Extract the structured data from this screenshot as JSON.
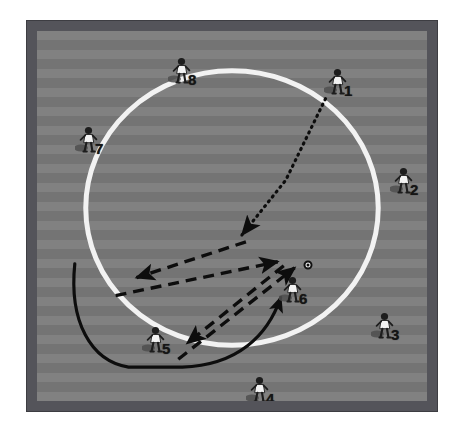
{
  "diagram": {
    "kind": "soccer-tactical-drill",
    "title": "",
    "field": {
      "frame_color": "#54545a",
      "grass_color": "#7c7c7c",
      "grass_stripe_color": "#747474",
      "line_color": "#f2f2f2",
      "background_color": "#ffffff"
    },
    "center_circle": {
      "label": "center-circle",
      "cx": 196,
      "cy": 178,
      "rx": 147,
      "ry": 138,
      "stroke_color": "#f2f2f2",
      "stroke_width": 5
    },
    "players": [
      {
        "id": "p1",
        "number": "1",
        "x": 300,
        "y": 51,
        "num_pos": "br",
        "has_ball": false
      },
      {
        "id": "p2",
        "number": "2",
        "x": 366,
        "y": 150,
        "num_pos": "br",
        "has_ball": false
      },
      {
        "id": "p3",
        "number": "3",
        "x": 347,
        "y": 295,
        "num_pos": "br",
        "has_ball": false
      },
      {
        "id": "p4",
        "number": "4",
        "x": 222,
        "y": 359,
        "num_pos": "br",
        "has_ball": false
      },
      {
        "id": "p5",
        "number": "5",
        "x": 118,
        "y": 309,
        "num_pos": "br",
        "has_ball": false
      },
      {
        "id": "p6",
        "number": "6",
        "x": 255,
        "y": 259,
        "num_pos": "br",
        "has_ball": true
      },
      {
        "id": "p7",
        "number": "7",
        "x": 51,
        "y": 109,
        "num_pos": "br",
        "has_ball": false
      },
      {
        "id": "p8",
        "number": "8",
        "x": 144,
        "y": 40,
        "num_pos": "br",
        "has_ball": false
      }
    ],
    "ball": {
      "label": "soccer-ball",
      "x": 271,
      "y": 234
    },
    "movement_paths": [
      {
        "id": "path-pass-from-1",
        "style": "dotted",
        "label": "pass-from-player-1-into-center",
        "points": "290,68 250,150 204,205",
        "arrowhead": "end"
      },
      {
        "id": "path-run-center-to-left",
        "style": "dashed",
        "label": "run-from-center-to-left",
        "points": "206,208 100,247",
        "arrowhead": "end"
      },
      {
        "id": "path-run-left-to-right",
        "style": "dashed",
        "label": "run-from-left-to-right",
        "points": "79,265 243,232",
        "arrowhead": "end"
      },
      {
        "id": "path-run-right-to-player5",
        "style": "dashed",
        "label": "run-from-right-down-to-player-5",
        "points": "244,234 150,313",
        "arrowhead": "end"
      },
      {
        "id": "path-run-player5-to-ball",
        "style": "dashed",
        "label": "run-from-player-5-up-to-ball",
        "points": "146,328 258,238",
        "arrowhead": "end"
      },
      {
        "id": "path-dribble-curve",
        "style": "solid-curve",
        "label": "dribble-path-curving-to-player-6",
        "points": "M 38,236 C 34,290 52,330 90,338 L 145,338 C 200,338 230,310 244,270",
        "arrowhead": "end"
      }
    ],
    "legend": {
      "dotted_meaning": "pass",
      "dashed_meaning": "player-run",
      "solid_meaning": "dribble"
    }
  }
}
